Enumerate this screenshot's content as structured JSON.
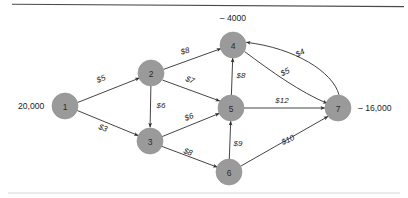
{
  "figure": {
    "background": "#ffffff",
    "node_fill": "#9a9a9a",
    "edge_color": "#2f2f2f",
    "rules": {
      "top_color": "#4a4a4a",
      "bottom_color": "#d8d8d8"
    }
  },
  "nodes": [
    {
      "id": "1",
      "label": "1",
      "cx": 65,
      "cy": 106,
      "r": 13
    },
    {
      "id": "2",
      "label": "2",
      "cx": 151,
      "cy": 73,
      "r": 13
    },
    {
      "id": "3",
      "label": "3",
      "cx": 150,
      "cy": 141,
      "r": 13
    },
    {
      "id": "4",
      "label": "4",
      "cx": 233,
      "cy": 45,
      "r": 13
    },
    {
      "id": "5",
      "label": "5",
      "cx": 231,
      "cy": 108,
      "r": 13
    },
    {
      "id": "6",
      "label": "6",
      "cx": 229,
      "cy": 172,
      "r": 13
    },
    {
      "id": "7",
      "label": "7",
      "cx": 338,
      "cy": 108,
      "r": 13
    }
  ],
  "supplies": [
    {
      "node": "1",
      "text": "20,000",
      "x": 18,
      "y": 106,
      "anchor": "start"
    },
    {
      "node": "4",
      "text": "– 4000",
      "x": 233,
      "y": 18,
      "anchor": "middle"
    },
    {
      "node": "7",
      "text": "– 16,000",
      "x": 358,
      "y": 108,
      "anchor": "start"
    }
  ],
  "edges": [
    {
      "id": "e-1-2",
      "from": "1",
      "to": "2",
      "cost": "$5",
      "lx": 101,
      "ly": 79,
      "rot": -21,
      "shape": "line"
    },
    {
      "id": "e-1-3",
      "from": "1",
      "to": "3",
      "cost": "$3",
      "lx": 103,
      "ly": 128,
      "rot": 21,
      "shape": "line"
    },
    {
      "id": "e-2-4",
      "from": "2",
      "to": "4",
      "cost": "$8",
      "lx": 185,
      "ly": 51,
      "rot": -16,
      "shape": "line"
    },
    {
      "id": "e-2-5",
      "from": "2",
      "to": "5",
      "cost": "$7",
      "lx": 190,
      "ly": 80,
      "rot": 21,
      "shape": "line"
    },
    {
      "id": "e-2-3",
      "from": "2",
      "to": "3",
      "cost": "$6",
      "lx": 161,
      "ly": 105,
      "rot": 0,
      "shape": "line"
    },
    {
      "id": "e-3-5",
      "from": "3",
      "to": "5",
      "cost": "$6",
      "lx": 189,
      "ly": 117,
      "rot": -21,
      "shape": "line"
    },
    {
      "id": "e-3-6",
      "from": "3",
      "to": "6",
      "cost": "$8",
      "lx": 188,
      "ly": 152,
      "rot": 21,
      "shape": "line"
    },
    {
      "id": "e-5-4",
      "from": "5",
      "to": "4",
      "cost": "$8",
      "lx": 241,
      "ly": 75,
      "rot": 0,
      "shape": "line"
    },
    {
      "id": "e-6-5",
      "from": "6",
      "to": "5",
      "cost": "$9",
      "lx": 238,
      "ly": 143,
      "rot": 0,
      "shape": "line"
    },
    {
      "id": "e-5-7",
      "from": "5",
      "to": "7",
      "cost": "$12",
      "lx": 282,
      "ly": 100,
      "rot": 0,
      "shape": "line"
    },
    {
      "id": "e-6-7",
      "from": "6",
      "to": "7",
      "cost": "$10",
      "lx": 288,
      "ly": 140,
      "rot": -25,
      "shape": "line"
    },
    {
      "id": "e-4-7",
      "from": "4",
      "to": "7",
      "cost": "$5",
      "lx": 285,
      "ly": 72,
      "rot": -27,
      "shape": "curve"
    },
    {
      "id": "e-7-4",
      "from": "7",
      "to": "4",
      "cost": "$4",
      "lx": 300,
      "ly": 53,
      "rot": -27,
      "shape": "curve"
    }
  ]
}
